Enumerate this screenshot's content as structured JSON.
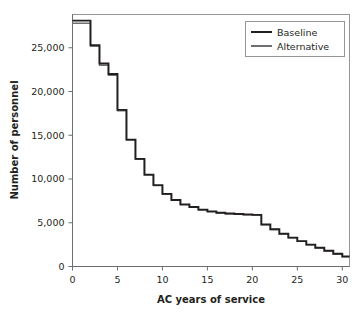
{
  "chart_data": {
    "type": "line",
    "title": "",
    "subtitle": "",
    "xlabel": "AC years of service",
    "ylabel": "Number of personnel",
    "xlim": [
      0,
      30.8
    ],
    "ylim": [
      0,
      28800
    ],
    "xticks": [
      0,
      5,
      10,
      15,
      20,
      25,
      30
    ],
    "xticklabels": [
      "0",
      "5",
      "10",
      "15",
      "20",
      "25",
      "30"
    ],
    "yticks": [
      0,
      5000,
      10000,
      15000,
      20000,
      25000
    ],
    "yticklabels": [
      "0",
      "5,000",
      "10,000",
      "15,000",
      "20,000",
      "25,000"
    ],
    "grid": false,
    "drawstyle": "steps-post",
    "legend": {
      "position": "top-right",
      "entries": [
        {
          "name": "Baseline",
          "color": "#231f20"
        },
        {
          "name": "Alternative",
          "color": "#6d6e71"
        }
      ]
    },
    "x": [
      0,
      1,
      2,
      3,
      4,
      5,
      6,
      7,
      8,
      9,
      10,
      11,
      12,
      13,
      14,
      15,
      16,
      17,
      18,
      19,
      20,
      21,
      22,
      23,
      24,
      25,
      26,
      27,
      28,
      29,
      30
    ],
    "series": [
      {
        "name": "Baseline",
        "color": "#231f20",
        "values": [
          28100,
          28100,
          25300,
          23200,
          22000,
          17900,
          14500,
          12300,
          10500,
          9300,
          8300,
          7600,
          7100,
          6800,
          6500,
          6300,
          6150,
          6050,
          6000,
          5950,
          5900,
          4800,
          4250,
          3750,
          3300,
          2900,
          2500,
          2150,
          1800,
          1450,
          1150
        ]
      },
      {
        "name": "Alternative",
        "color": "#6d6e71",
        "values": [
          27800,
          27800,
          25150,
          23000,
          21850,
          17800,
          14450,
          12250,
          10450,
          9250,
          8250,
          7550,
          7050,
          6750,
          6450,
          6250,
          6120,
          6030,
          5980,
          5930,
          5880,
          4780,
          4230,
          3730,
          3280,
          2880,
          2480,
          2130,
          1780,
          1430,
          1130
        ]
      }
    ]
  },
  "axes": {
    "ylabel": "Number of personnel",
    "xlabel": "AC years of service"
  }
}
